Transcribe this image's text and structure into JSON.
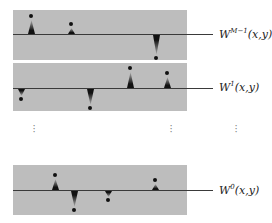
{
  "diagram": {
    "layers": [
      {
        "id": "top",
        "label_base": "W",
        "label_sup": "M−1",
        "label_args": "(x,y)",
        "panel": {
          "top": 10,
          "height": 50
        },
        "baseline_y": 34,
        "spikes": [
          {
            "x": 31,
            "dir": "up",
            "tip_y": 16
          },
          {
            "x": 71,
            "dir": "up",
            "tip_y": 24
          },
          {
            "x": 156,
            "dir": "down",
            "tip_y": 58
          }
        ]
      },
      {
        "id": "middle",
        "label_base": "W",
        "label_sup": "1",
        "label_args": "(x,y)",
        "panel": {
          "top": 63,
          "height": 48
        },
        "baseline_y": 88,
        "spikes": [
          {
            "x": 21,
            "dir": "down",
            "tip_y": 99
          },
          {
            "x": 90,
            "dir": "down",
            "tip_y": 108
          },
          {
            "x": 130,
            "dir": "up",
            "tip_y": 68
          },
          {
            "x": 167,
            "dir": "up",
            "tip_y": 73
          }
        ]
      },
      {
        "id": "bottom",
        "label_base": "W",
        "label_sup": "0",
        "label_args": "(x,y)",
        "panel": {
          "top": 165,
          "height": 50
        },
        "baseline_y": 190,
        "spikes": [
          {
            "x": 55,
            "dir": "up",
            "tip_y": 175
          },
          {
            "x": 74,
            "dir": "down",
            "tip_y": 210
          },
          {
            "x": 108,
            "dir": "down",
            "tip_y": 200
          },
          {
            "x": 155,
            "dir": "up",
            "tip_y": 180
          }
        ]
      }
    ],
    "ellipsis": {
      "symbol": "⋮",
      "positions_x": [
        34,
        171,
        236
      ],
      "y": 124
    },
    "colors": {
      "panel": "#bdbdbd",
      "axis": "#3a3a3a",
      "spike": "#111111",
      "text": "#222222"
    }
  },
  "labels": {
    "top": {
      "base": "W",
      "sup": "M−1",
      "args": "(x,y)"
    },
    "middle": {
      "base": "W",
      "sup": "1",
      "args": "(x,y)"
    },
    "bottom": {
      "base": "W",
      "sup": "0",
      "args": "(x,y)"
    }
  }
}
